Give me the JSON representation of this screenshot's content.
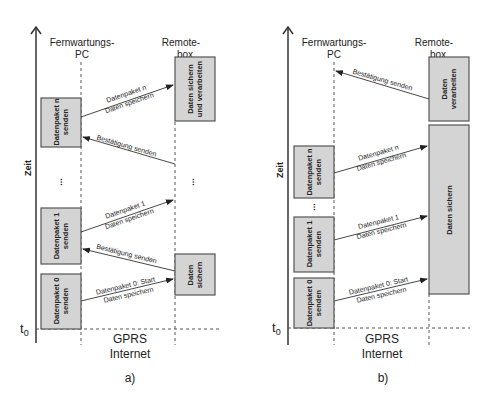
{
  "figure": {
    "axis_label": "Zeit",
    "t0_label": "t",
    "t0_subscript": "0",
    "network_label_1": "GPRS",
    "network_label_2": "Internet",
    "colors": {
      "box_fill": "#d4d4d4",
      "box_stroke": "#555555",
      "line": "#333333"
    }
  },
  "panel_a": {
    "caption": "a)",
    "pc_header_1": "Fernwartungs-",
    "pc_header_2": "PC",
    "remote_header_1": "Remote-",
    "remote_header_2": "box",
    "pc_boxes": [
      {
        "line1": "Datenpaket n",
        "line2": "senden"
      },
      {
        "line1": "Datenpaket 1",
        "line2": "senden"
      },
      {
        "line1": "Datenpaket 0",
        "line2": "senden"
      }
    ],
    "remote_boxes": [
      {
        "line1": "Daten sichern",
        "line2": "und verarbeiten"
      },
      {
        "line1": "Daten",
        "line2": "sichern"
      }
    ],
    "ellipsis": "...",
    "messages": [
      {
        "line1": "Datenpaket n",
        "line2": "Daten speichern"
      },
      {
        "line1": "Bestätigung senden"
      },
      {
        "line1": "Datenpaket 1",
        "line2": "Daten speichern"
      },
      {
        "line1": "Bestätigung senden"
      },
      {
        "line1": "Datenpaket 0: Start",
        "line2": "Daten speichern"
      }
    ]
  },
  "panel_b": {
    "caption": "b)",
    "pc_header_1": "Fernwartungs-",
    "pc_header_2": "PC",
    "remote_header_1": "Remote-",
    "remote_header_2": "box",
    "pc_boxes": [
      {
        "line1": "Datenpaket n",
        "line2": "senden"
      },
      {
        "line1": "Datenpaket 1",
        "line2": "senden"
      },
      {
        "line1": "Datenpaket 0",
        "line2": "senden"
      }
    ],
    "remote_boxes": [
      {
        "line1": "Daten",
        "line2": "verarbeiten"
      },
      {
        "line1": "Daten sichern"
      }
    ],
    "ellipsis": "...",
    "messages": [
      {
        "line1": "Bestätigung senden"
      },
      {
        "line1": "Datenpaket n",
        "line2": "Daten speichern"
      },
      {
        "line1": "Datenpaket 1",
        "line2": "Daten speichern"
      },
      {
        "line1": "Datenpaket 0: Start",
        "line2": "Daten speichern"
      }
    ]
  }
}
